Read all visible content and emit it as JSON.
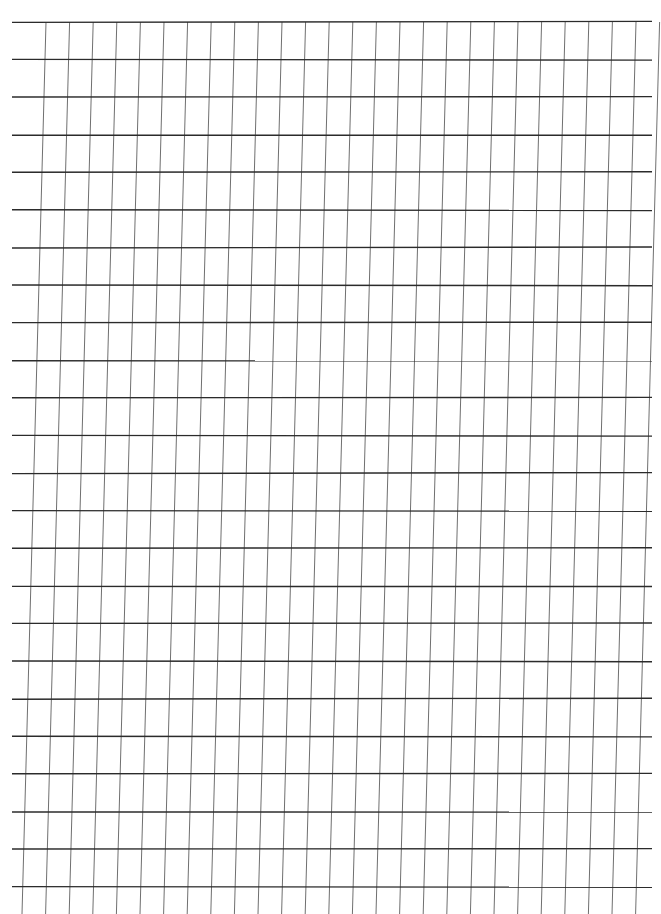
{
  "document": {
    "type": "handwriting practice sheet",
    "header_text": "",
    "horizontal_rule_count": 24,
    "slant_guide_count": 27
  },
  "colors": {
    "paper": "#ffffff",
    "horizontal_rule": "#2b2b2b",
    "slant_guide": "#4a4a4a"
  }
}
